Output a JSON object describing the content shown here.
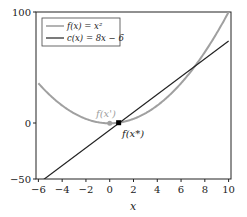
{
  "chart_data": {
    "type": "line",
    "title": "",
    "xlabel": "x",
    "ylabel": "",
    "xlim": [
      -6.2,
      10.2
    ],
    "ylim": [
      -50,
      100
    ],
    "grid": false,
    "legend_position": "upper left",
    "x_ticks": [
      -6,
      -4,
      -2,
      0,
      2,
      4,
      6,
      8,
      10
    ],
    "x_tick_labels": [
      "−6",
      "−4",
      "−2",
      "0",
      "2",
      "4",
      "6",
      "8",
      "10"
    ],
    "y_ticks": [
      -50,
      0,
      100
    ],
    "y_tick_labels": [
      "−50",
      "0",
      "100"
    ],
    "series": [
      {
        "name": "f(x) = x²",
        "expression": "x^2",
        "color": "#a0a0a0",
        "x": [
          -6,
          -4,
          -2,
          0,
          2,
          4,
          6,
          8,
          10
        ],
        "values": [
          36,
          16,
          4,
          0,
          4,
          16,
          36,
          64,
          100
        ]
      },
      {
        "name": "c(x) = 8x − 6",
        "expression": "8x-6",
        "color": "#222222",
        "x": [
          -6,
          -4,
          -2,
          0,
          2,
          4,
          6,
          8,
          10
        ],
        "values": [
          -54,
          -38,
          -22,
          -6,
          10,
          26,
          42,
          58,
          74
        ]
      }
    ],
    "annotations": [
      {
        "text": "f(x')",
        "x": 0,
        "y": 0,
        "color": "#a0a0a0"
      },
      {
        "text": "f(x*)",
        "x": 0.75,
        "y": 0.5625,
        "color": "#222222"
      }
    ]
  },
  "legend": {
    "items": [
      {
        "label": "f(x) = x²",
        "color": "#a0a0a0"
      },
      {
        "label": "c(x) = 8x − 6",
        "color": "#222222"
      }
    ]
  },
  "axis": {
    "xlabel": "x",
    "x_ticks": [
      "−6",
      "−4",
      "−2",
      "0",
      "2",
      "4",
      "6",
      "8",
      "10"
    ],
    "y_ticks": [
      "100",
      "0",
      "−50"
    ]
  },
  "annotations": {
    "prime": "f(x')",
    "star": "f(x*)"
  }
}
